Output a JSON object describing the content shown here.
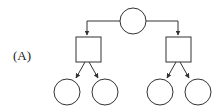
{
  "figure": {
    "label": "(A)"
  },
  "colors": {
    "stroke": "#333333",
    "fill": "#ffffff",
    "background": "#ffffff"
  },
  "nodes": {
    "root": {
      "shape": "circle"
    },
    "left_square": {
      "shape": "square"
    },
    "right_square": {
      "shape": "square"
    },
    "leaves": [
      {
        "shape": "circle",
        "parent": "left_square"
      },
      {
        "shape": "circle",
        "parent": "left_square"
      },
      {
        "shape": "circle",
        "parent": "right_square"
      },
      {
        "shape": "circle",
        "parent": "right_square"
      }
    ]
  }
}
